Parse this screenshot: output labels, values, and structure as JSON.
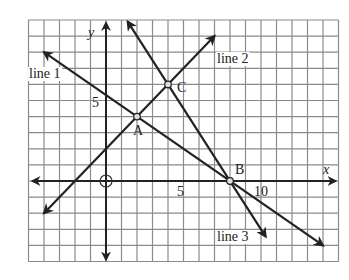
{
  "figure": {
    "grid": {
      "x_min": -5,
      "x_max": 15,
      "y_min": -5,
      "y_max": 10,
      "color": "#8a8a8a"
    },
    "axes": {
      "x_label": "x",
      "y_label": "y",
      "origin_label": "O",
      "tick_labels": {
        "x5": "5",
        "x10": "10",
        "y5": "5"
      }
    },
    "points": [
      {
        "name": "A",
        "x": 2,
        "y": 4
      },
      {
        "name": "B",
        "x": 8,
        "y": 0
      },
      {
        "name": "C",
        "x": 4,
        "y": 6
      }
    ],
    "lines": [
      {
        "label": "line 1",
        "from": [
          -4,
          8
        ],
        "to": [
          14,
          -4
        ]
      },
      {
        "label": "line 2",
        "from": [
          -4,
          -2
        ],
        "to": [
          7,
          9
        ]
      },
      {
        "label": "line 3",
        "from": [
          1.4,
          9.9
        ],
        "to": [
          10.3,
          -3.45
        ]
      }
    ],
    "line_color": "#222222"
  }
}
